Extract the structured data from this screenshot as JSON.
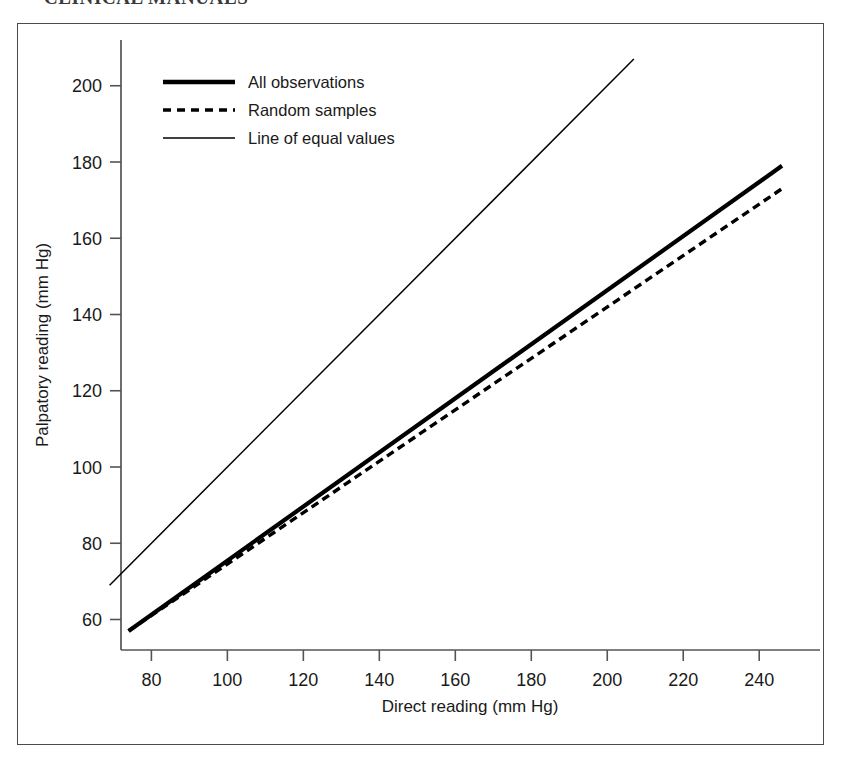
{
  "page": {
    "clipped_header_text": "CLINICAL MANUALS"
  },
  "figure": {
    "frame_color": "#4a4a4a",
    "background": "#ffffff"
  },
  "chart_data": {
    "type": "line",
    "title": "",
    "xlabel": "Direct reading (mm Hg)",
    "ylabel": "Palpatory reading (mm Hg)",
    "xlim": [
      72,
      256
    ],
    "ylim": [
      52,
      212
    ],
    "xticks": [
      80,
      100,
      120,
      140,
      160,
      180,
      200,
      220,
      240
    ],
    "yticks": [
      60,
      80,
      100,
      120,
      140,
      160,
      180,
      200
    ],
    "xtick_labels": [
      "80",
      "100",
      "120",
      "140",
      "160",
      "180",
      "200",
      "220",
      "240"
    ],
    "ytick_labels": [
      "60",
      "80",
      "100",
      "120",
      "140",
      "160",
      "180",
      "200"
    ],
    "grid": false,
    "legend_position": "upper left",
    "series": [
      {
        "name": "All observations",
        "style": "solid",
        "line_width": 4.2,
        "color": "#000000",
        "x": [
          74,
          246
        ],
        "y": [
          57,
          179
        ]
      },
      {
        "name": "Random samples",
        "style": "dashed",
        "line_width": 3.4,
        "color": "#000000",
        "x": [
          74,
          246
        ],
        "y": [
          57,
          173
        ]
      },
      {
        "name": "Line of equal values",
        "style": "solid",
        "line_width": 1.5,
        "color": "#000000",
        "x": [
          69,
          207
        ],
        "y": [
          69,
          207
        ]
      }
    ],
    "legend": [
      {
        "label": "All observations",
        "style": "solid-thick"
      },
      {
        "label": "Random samples",
        "style": "dashed"
      },
      {
        "label": "Line of equal values",
        "style": "solid-thin"
      }
    ]
  }
}
